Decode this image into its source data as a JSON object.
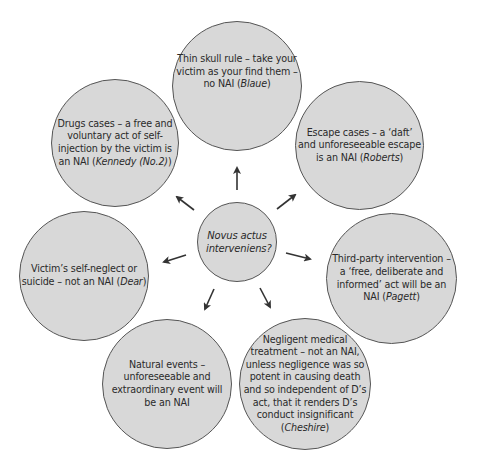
{
  "diagram": {
    "type": "hub-and-spoke",
    "colors": {
      "circle_fill": "#d8d8d8",
      "circle_stroke": "#555555",
      "arrow": "#333333",
      "text": "#2a2a2a"
    },
    "center": {
      "text": "Novus actus interveniens?"
    },
    "nodes": [
      {
        "id": "thin-skull",
        "text": "Thin skull rule – take your victim as your find them – no NAI (",
        "case": "Blaue",
        "suffix": ")"
      },
      {
        "id": "escape",
        "text": "Escape cases – a ‘daft’ and unforeseeable escape is an NAI (",
        "case": "Roberts",
        "suffix": ")"
      },
      {
        "id": "third-party",
        "text": "Third-party intervention – a ‘free, deliberate and informed’ act will be an NAI (",
        "case": "Pagett",
        "suffix": ")"
      },
      {
        "id": "negligent-medical",
        "text": "Negligent medical treatment – not an NAI, unless negligence was so potent in causing death and so independent of D’s act, that it renders D’s conduct insignificant (",
        "case": "Cheshire",
        "suffix": ")"
      },
      {
        "id": "natural-events",
        "text": "Natural events – unforeseeable and extraordinary event will be an NAI",
        "case": "",
        "suffix": ""
      },
      {
        "id": "self-neglect",
        "text": "Victim’s self-neglect or suicide – not an NAI (",
        "case": "Dear",
        "suffix": ")"
      },
      {
        "id": "drugs",
        "text": "Drugs cases – a free and voluntary act of self-injection by the victim is an NAI (",
        "case": "Kennedy (No.2)",
        "suffix": ")"
      }
    ]
  }
}
